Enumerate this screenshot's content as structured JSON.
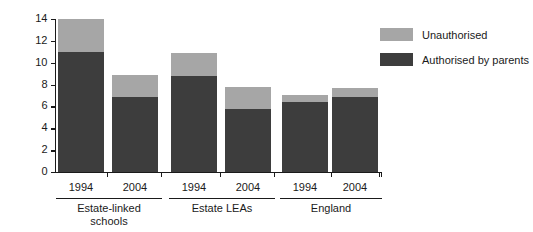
{
  "chart_data": {
    "type": "bar",
    "subtype": "stacked",
    "title": "",
    "xlabel": "",
    "ylabel": "Percentage of students",
    "ylim": [
      0,
      14
    ],
    "ytick_values": [
      0,
      2,
      4,
      6,
      8,
      10,
      12,
      14
    ],
    "ytick_labels": [
      "0",
      "2",
      "4",
      "6",
      "8",
      "10",
      "12",
      "14"
    ],
    "grid": false,
    "legend_position": "top-right",
    "categories": [
      "1994",
      "2004",
      "1994",
      "2004",
      "1994",
      "2004"
    ],
    "groups": [
      {
        "label": "Estate-linked\nschools",
        "categories": [
          "1994",
          "2004"
        ]
      },
      {
        "label": "Estate LEAs",
        "categories": [
          "1994",
          "2004"
        ]
      },
      {
        "label": "England",
        "categories": [
          "1994",
          "2004"
        ]
      }
    ],
    "series": [
      {
        "name": "Authorised by parents",
        "color": "#3d3d3d",
        "values": [
          11.0,
          6.9,
          8.8,
          5.8,
          6.4,
          6.9
        ]
      },
      {
        "name": "Unauthorised",
        "color": "#a6a6a6",
        "values": [
          3.0,
          2.0,
          2.1,
          2.0,
          0.65,
          0.8
        ]
      }
    ],
    "totals": [
      14.0,
      8.9,
      10.9,
      7.8,
      7.05,
      7.7
    ]
  },
  "legend": {
    "items": [
      {
        "label": "Unauthorised",
        "color": "#a6a6a6"
      },
      {
        "label": "Authorised by parents",
        "color": "#3d3d3d"
      }
    ]
  }
}
